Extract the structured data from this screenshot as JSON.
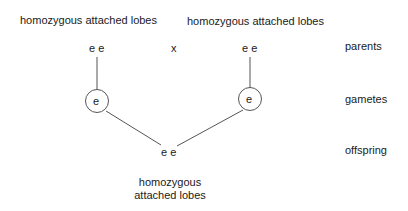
{
  "parents": {
    "left": {
      "phenotype": "homozygous attached lobes",
      "genotype": "e e"
    },
    "right": {
      "phenotype": "homozygous attached lobes",
      "genotype": "e e"
    },
    "cross_symbol": "x"
  },
  "gametes": {
    "left": "e",
    "right": "e"
  },
  "offspring": {
    "genotype": "e e",
    "phenotype_line1": "homozygous",
    "phenotype_line2": "attached lobes"
  },
  "row_labels": {
    "parents": "parents",
    "gametes": "gametes",
    "offspring": "offspring"
  },
  "colors": {
    "line": "#555555",
    "text": "#1a1a1a"
  }
}
